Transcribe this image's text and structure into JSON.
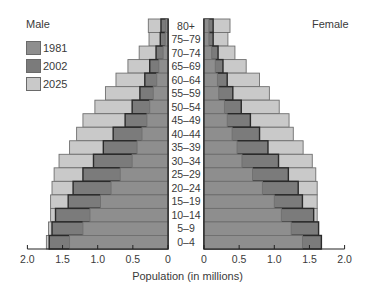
{
  "chart_data": {
    "type": "bar",
    "subtype": "population-pyramid",
    "title": "",
    "xlabel": "Population (in millions)",
    "ylabel": "",
    "left_title": "Male",
    "right_title": "Female",
    "categories": [
      "80+",
      "75–79",
      "70–74",
      "65–69",
      "60–64",
      "55–59",
      "50–54",
      "45–49",
      "40–44",
      "35–39",
      "30–34",
      "25–29",
      "20–24",
      "15–19",
      "10–14",
      "5–9",
      "0–4"
    ],
    "xlim": [
      0,
      2.0
    ],
    "xticks": [
      "2.0",
      "1.5",
      "1.0",
      "0.5",
      "0",
      "0",
      "0.5",
      "1.0",
      "1.5",
      "2.0"
    ],
    "grid": false,
    "legend": {
      "position": "upper-left",
      "entries": [
        "1981",
        "2002",
        "2025"
      ]
    },
    "series": [
      {
        "name": "1981",
        "color": "#8e8e8e",
        "male": [
          0.03,
          0.04,
          0.07,
          0.13,
          0.16,
          0.21,
          0.26,
          0.3,
          0.37,
          0.44,
          0.51,
          0.68,
          0.81,
          0.96,
          1.11,
          1.21,
          1.4
        ],
        "female": [
          0.07,
          0.07,
          0.11,
          0.16,
          0.19,
          0.21,
          0.29,
          0.33,
          0.4,
          0.47,
          0.54,
          0.69,
          0.83,
          1.0,
          1.1,
          1.24,
          1.4
        ]
      },
      {
        "name": "2002",
        "color": "#7b7b7b",
        "male": [
          0.1,
          0.11,
          0.17,
          0.26,
          0.33,
          0.4,
          0.51,
          0.61,
          0.78,
          0.92,
          1.06,
          1.21,
          1.35,
          1.42,
          1.6,
          1.65,
          1.69
        ],
        "female": [
          0.13,
          0.13,
          0.2,
          0.27,
          0.33,
          0.41,
          0.53,
          0.66,
          0.79,
          0.91,
          1.06,
          1.2,
          1.34,
          1.4,
          1.56,
          1.63,
          1.67
        ]
      },
      {
        "name": "2025",
        "color": "#c9c9c9",
        "male": [
          0.28,
          0.27,
          0.41,
          0.57,
          0.74,
          0.89,
          1.04,
          1.21,
          1.3,
          1.4,
          1.55,
          1.62,
          1.65,
          1.67,
          1.67,
          1.7,
          1.73
        ],
        "female": [
          0.37,
          0.34,
          0.44,
          0.6,
          0.79,
          0.93,
          1.07,
          1.21,
          1.27,
          1.41,
          1.54,
          1.59,
          1.61,
          1.61,
          1.61,
          1.63,
          1.66
        ]
      }
    ]
  }
}
